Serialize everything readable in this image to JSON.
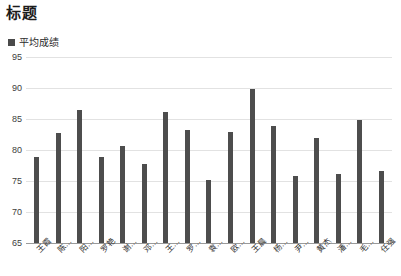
{
  "chart_data": {
    "type": "bar",
    "title": "标题",
    "xlabel": "",
    "ylabel": "",
    "ylim": [
      65,
      95
    ],
    "yticks": [
      65,
      70,
      75,
      80,
      85,
      90,
      95
    ],
    "grid": true,
    "legend_position": "top-left",
    "legend": [
      "平均成绩"
    ],
    "bar_color": "#4d4d4d",
    "categories": [
      "王霞",
      "陈…",
      "阳…",
      "罗艳",
      "谢…",
      "邓…",
      "王…",
      "罗…",
      "袁…",
      "欧…",
      "王晨",
      "杨…",
      "尹…",
      "黄杰",
      "潘…",
      "毛…",
      "任强"
    ],
    "series": [
      {
        "name": "平均成绩",
        "values": [
          78.9,
          82.7,
          86.5,
          78.9,
          80.7,
          77.8,
          86.2,
          83.3,
          75.1,
          82.9,
          89.8,
          83.8,
          75.8,
          82.0,
          76.2,
          84.8,
          76.6
        ]
      }
    ]
  },
  "colors": {
    "bar": "#4d4d4d",
    "grid": "#e2e2e2",
    "axis": "#9a9a9a",
    "title_text": "#1b1b1b",
    "tick_text": "#3d3d3d",
    "background": "#ffffff"
  }
}
